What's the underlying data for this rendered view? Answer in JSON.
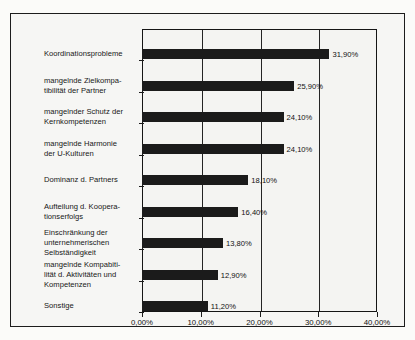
{
  "chart_data": {
    "type": "bar",
    "orientation": "horizontal",
    "title": "",
    "xlabel": "",
    "ylabel": "",
    "xlim": [
      0,
      40
    ],
    "grid": true,
    "legend": null,
    "value_suffix": "%",
    "decimal_separator": ",",
    "categories": [
      "Koordinationsprobleme",
      "mangelnde Zielkompa-\ntibilität der Partner",
      "mangelnder Schutz der\nKernkompetenzen",
      "mangelnde Harmonie\nder U-Kulturen",
      "Dominanz d. Partners",
      "Aufteilung d. Koopera-\ntionserfolgs",
      "Einschränkung der\nunternehmerischen\nSelbständigkeit",
      "mangelnde Kompabiti-\nlität d. Aktivitäten und\nKompetenzen",
      "Sonstige"
    ],
    "values": [
      31.9,
      25.9,
      24.1,
      24.1,
      18.1,
      16.4,
      13.8,
      12.9,
      11.2
    ],
    "value_labels": [
      "31,90%",
      "25,90%",
      "24,10%",
      "24,10%",
      "18,10%",
      "16,40%",
      "13,80%",
      "12,90%",
      "11,20%"
    ],
    "xticks": [
      0,
      10,
      20,
      30,
      40
    ],
    "xtick_labels": [
      "0,00%",
      "10,00%",
      "20,00%",
      "30,00%",
      "40,00%"
    ],
    "colors": {
      "bar": "#1b1b1b",
      "axis": "#1c1c1c",
      "grid": "#242424",
      "text": "#121212",
      "plot_background": "#f4f4f2",
      "figure_background": "#f6f6f4"
    }
  }
}
